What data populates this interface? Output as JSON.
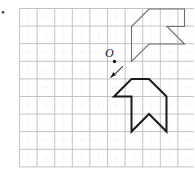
{
  "figure": {
    "type": "geometry-diagram",
    "background_color": "#ffffff",
    "width": 194,
    "height": 171
  },
  "grid": {
    "name": "square-grid",
    "origin_x": 19.5,
    "origin_y": 8.5,
    "cell_size": 17.6,
    "cols": 10,
    "rows": 9,
    "major_color": "#b9bcc2",
    "major_width": 0.9,
    "minor_color": "#d8dade",
    "minor_width": 0.5,
    "minor_dash": "1,2",
    "minor_enabled": true
  },
  "labels": {
    "centre_label": "O",
    "corner_mark": "•"
  },
  "centre_point": {
    "name": "rotation-centre",
    "x": 114.5,
    "y": 61.5,
    "radius": 1.7,
    "color": "#1a1a1a",
    "label_x": 105,
    "label_y": 57
  },
  "rotation_arrow": {
    "name": "rotation-arrow",
    "path": "M 122.5 66.5 C 119.0 70.5 115.0 74.0 110.8 77.2",
    "head": "M 110.8 77.2 L 116.0 75.2 L 113.2 72.0 Z",
    "color": "#1a1a1a",
    "width": 1.1
  },
  "shapes": [
    {
      "name": "original-polygon",
      "role": "pre-image",
      "stroke": "#6d6f74",
      "stroke_width": 1.1,
      "fill": "none",
      "points": "131.5 26.5 149.0 9.0 184.5 9.0 184.5 26.5 167.0 26.5 184.5 44.0 149.0 44.0 131.5 61.5"
    },
    {
      "name": "rotated-polygon",
      "role": "image",
      "stroke": "#1a1a1a",
      "stroke_width": 2.0,
      "fill": "none",
      "points": "114.0 96.5 131.5 79.0 149.0 79.0 166.5 96.5 166.5 131.5 149.0 114.0 131.5 131.5 131.5 96.5"
    }
  ],
  "chart_data": {
    "type": "scatter",
    "grid": true,
    "xlabel": "",
    "ylabel": "",
    "annotations": [
      "O",
      "rotation arrow (clockwise)"
    ],
    "series": [
      {
        "name": "original-polygon",
        "closed": true,
        "points": [
          [
            6.4,
            8.0
          ],
          [
            7.4,
            9.0
          ],
          [
            9.4,
            9.0
          ],
          [
            9.4,
            8.0
          ],
          [
            8.4,
            8.0
          ],
          [
            9.4,
            7.0
          ],
          [
            7.4,
            7.0
          ],
          [
            6.4,
            6.0
          ]
        ]
      },
      {
        "name": "rotated-polygon",
        "closed": true,
        "points": [
          [
            5.4,
            4.0
          ],
          [
            6.4,
            5.0
          ],
          [
            7.4,
            5.0
          ],
          [
            8.4,
            4.0
          ],
          [
            8.4,
            2.0
          ],
          [
            7.4,
            3.0
          ],
          [
            6.4,
            2.0
          ],
          [
            6.4,
            4.0
          ]
        ]
      },
      {
        "name": "centre-O",
        "closed": false,
        "points": [
          [
            5.4,
            6.0
          ]
        ]
      }
    ]
  }
}
